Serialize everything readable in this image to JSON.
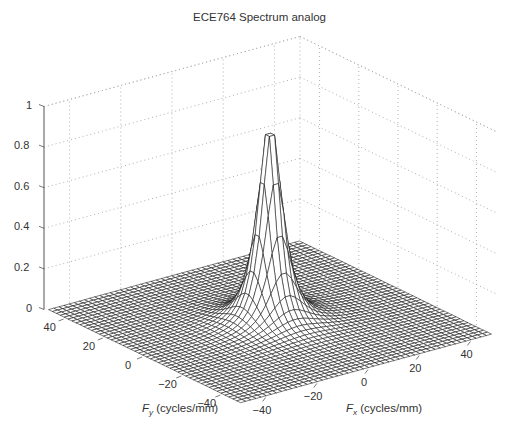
{
  "chart_data": {
    "type": "surface",
    "title": "ECE764 Spectrum analog",
    "xlabel": "F_x (cycles/mm)",
    "ylabel": "F_y (cycles/mm)",
    "zlabel": "",
    "xlabel_parts": {
      "symbol": "F",
      "sub": "x",
      "units": " (cycles/mm)"
    },
    "ylabel_parts": {
      "symbol": "F",
      "sub": "y",
      "units": " (cycles/mm)"
    },
    "xlim": [
      -50,
      50
    ],
    "ylim": [
      -50,
      50
    ],
    "zlim": [
      0,
      1
    ],
    "x_ticks": [
      -40,
      -20,
      0,
      20,
      40
    ],
    "y_ticks": [
      -40,
      -20,
      0,
      20,
      40
    ],
    "z_ticks": [
      0,
      0.2,
      0.4,
      0.6,
      0.8,
      1
    ],
    "x_tick_labels": [
      "−40",
      "−20",
      "0",
      "20",
      "40"
    ],
    "y_tick_labels": [
      "−40",
      "−20",
      "0",
      "20",
      "40"
    ],
    "z_tick_labels": [
      "0",
      "0.2",
      "0.4",
      "0.6",
      "0.8",
      "1"
    ],
    "grid": true,
    "grid_style": "dotted",
    "surface": {
      "description": "Radially symmetric sharp peak centered at (0,0), decaying to ~0 by |F| > 20",
      "peak": {
        "Fx": 0,
        "Fy": 0,
        "z": 0.93
      },
      "model": "z = 1 / (1 + (r/r0)^2)^1.5",
      "r0": 6,
      "grid_step": 2,
      "mesh_color": "#111111",
      "face_color": "#ffffff"
    },
    "legend": null
  },
  "colors": {
    "background": "#ffffff",
    "grid": "#b0b0b0",
    "axis": "#555555",
    "mesh": "#111111"
  }
}
